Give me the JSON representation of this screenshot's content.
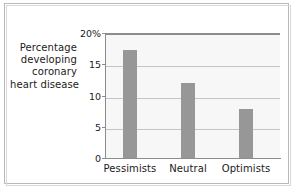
{
  "chart_data": {
    "type": "bar",
    "title": "",
    "xlabel": "",
    "ylabel": "Percentage developing coronary heart disease",
    "ylabel_lines": [
      "Percentage",
      "developing",
      "coronary",
      "heart disease"
    ],
    "categories": [
      "Pessimists",
      "Neutral",
      "Optimists"
    ],
    "values": [
      17.3,
      12.0,
      7.8
    ],
    "ylim": [
      0,
      20
    ],
    "yticks": [
      0,
      5,
      10,
      15,
      20
    ],
    "ytick_labels": [
      "0",
      "5",
      "10",
      "15",
      "20%"
    ],
    "grid": true,
    "legend": "none",
    "bar_color": "#979797",
    "plot_background": "#f7f7f7",
    "gridline_color": "#c5c5c5",
    "axis_color": "#8c8c8c",
    "frame_color": "#b9b9b9",
    "text_color": "#1b1b1b"
  }
}
